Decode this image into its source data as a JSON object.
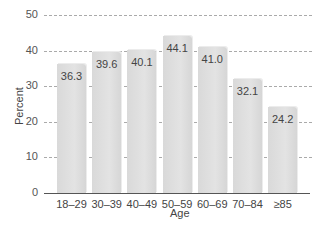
{
  "chart_data": {
    "type": "bar",
    "title": "",
    "xlabel": "Age",
    "ylabel": "Percent",
    "categories": [
      "18–29",
      "30–39",
      "40–49",
      "50–59",
      "60–69",
      "70–84",
      "≥85"
    ],
    "values": [
      36.3,
      39.6,
      40.1,
      44.1,
      41.0,
      32.1,
      24.2
    ],
    "value_labels": [
      "36.3",
      "39.6",
      "40.1",
      "44.1",
      "41.0",
      "32.1",
      "24.2"
    ],
    "ylim": [
      0,
      50
    ],
    "yticks": [
      "0",
      "10",
      "20",
      "30",
      "40",
      "50"
    ],
    "grid": "dashed horizontal",
    "legend": null
  }
}
